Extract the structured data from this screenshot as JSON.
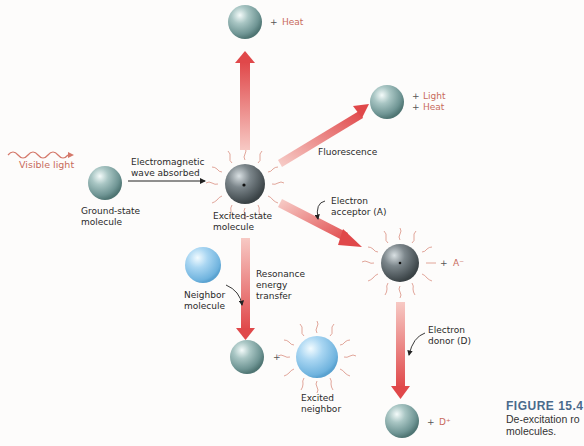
{
  "figure": {
    "number": "FIGURE 15.4",
    "caption_line1": "De-excitation ro",
    "caption_line2": "molecules."
  },
  "labels": {
    "visible_light": "Visible light",
    "em_absorbed_1": "Electromagnetic",
    "em_absorbed_2": "wave absorbed",
    "ground_state_1": "Ground-state",
    "ground_state_2": "molecule",
    "excited_state_1": "Excited-state",
    "excited_state_2": "molecule",
    "heat_top": "Heat",
    "light": "Light",
    "heat_right": "Heat",
    "fluorescence": "Fluorescence",
    "electron_acceptor_1": "Electron",
    "electron_acceptor_2": "acceptor (A)",
    "a_minus": "A⁻",
    "neighbor_1": "Neighbor",
    "neighbor_2": "molecule",
    "resonance_1": "Resonance",
    "resonance_2": "energy",
    "resonance_3": "transfer",
    "excited_neighbor_1": "Excited",
    "excited_neighbor_2": "neighbor",
    "electron_donor_1": "Electron",
    "electron_donor_2": "donor (D)",
    "d_plus": "D⁺",
    "plus": "+"
  },
  "colors": {
    "arrow_red": "#e0504f",
    "label_red": "#c86b5c",
    "ground_molecule": "#7fa3a3",
    "excited_molecule": "#5b6468",
    "neighbor_molecule": "#8fc4e6",
    "caption_blue": "#4a6a8c"
  }
}
